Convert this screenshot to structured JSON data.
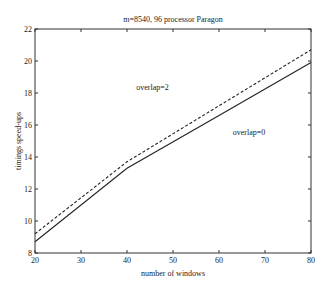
{
  "chart_data": {
    "type": "line",
    "title": "m=8540, 96 processor Paragon",
    "xlabel": "number of windows",
    "ylabel": "timings speed-ups",
    "xlim": [
      20,
      80
    ],
    "ylim": [
      8,
      22
    ],
    "xticks": [
      20,
      30,
      40,
      50,
      60,
      70,
      80
    ],
    "yticks": [
      8,
      10,
      12,
      14,
      16,
      18,
      20,
      22
    ],
    "grid": false,
    "legend": "none (inline annotations)",
    "x": [
      20,
      40,
      60,
      80
    ],
    "series": [
      {
        "name": "overlap=2",
        "style": "dashed",
        "values": [
          9.2,
          13.7,
          17.2,
          20.7
        ]
      },
      {
        "name": "overlap=0",
        "style": "solid",
        "values": [
          8.7,
          13.3,
          16.6,
          19.9
        ]
      }
    ],
    "annotations": [
      {
        "text": "overlap=2",
        "x": 42,
        "y": 18.2
      },
      {
        "text": "overlap=0",
        "x": 63,
        "y": 15.4
      }
    ]
  },
  "layout": {
    "plot": {
      "left": 35,
      "right": 311,
      "top": 29,
      "bottom": 253
    },
    "line_color": "#222222",
    "axis_color": "#333333"
  }
}
